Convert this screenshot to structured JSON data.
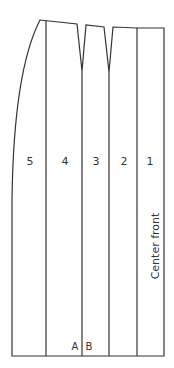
{
  "diagram": {
    "type": "skirt-pattern-front",
    "line_color": "#333333",
    "panels": [
      {
        "id": "5",
        "label": "5"
      },
      {
        "id": "4",
        "label": "4"
      },
      {
        "id": "3",
        "label": "3"
      },
      {
        "id": "2",
        "label": "2"
      },
      {
        "id": "1",
        "label": "1"
      }
    ],
    "side_label": "Center front",
    "point_a": "A",
    "point_b": "B"
  }
}
